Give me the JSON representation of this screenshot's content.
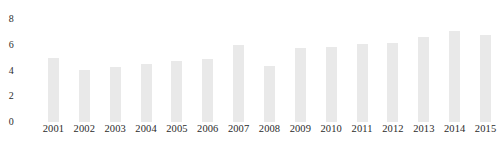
{
  "chart_data": {
    "type": "bar",
    "title": "",
    "subtitle": "",
    "xlabel": "",
    "ylabel": "",
    "categories": [
      "2001",
      "2002",
      "2003",
      "2004",
      "2005",
      "2006",
      "2007",
      "2008",
      "2009",
      "2010",
      "2011",
      "2012",
      "2013",
      "2014",
      "2015"
    ],
    "values": [
      5.0,
      4.05,
      4.3,
      4.5,
      4.75,
      4.9,
      6.0,
      4.35,
      5.75,
      5.8,
      6.05,
      6.15,
      6.6,
      7.05,
      6.75
    ],
    "series": [
      {
        "name": "",
        "values": [
          5.0,
          4.05,
          4.3,
          4.5,
          4.75,
          4.9,
          6.0,
          4.35,
          5.75,
          5.8,
          6.05,
          6.15,
          6.6,
          7.05,
          6.75
        ]
      }
    ],
    "ylim": [
      0,
      8
    ],
    "xlim_categories": 15,
    "y_ticks": [
      0,
      2,
      4,
      6,
      8
    ],
    "y_tick_labels": [
      "0",
      "2",
      "4",
      "6",
      "8"
    ],
    "grid": false,
    "legend": false,
    "legend_position": "none",
    "annotations": [],
    "bar_color": "#e9e9e9",
    "text_color": "#2b2b2b",
    "background_color": "#ffffff"
  }
}
